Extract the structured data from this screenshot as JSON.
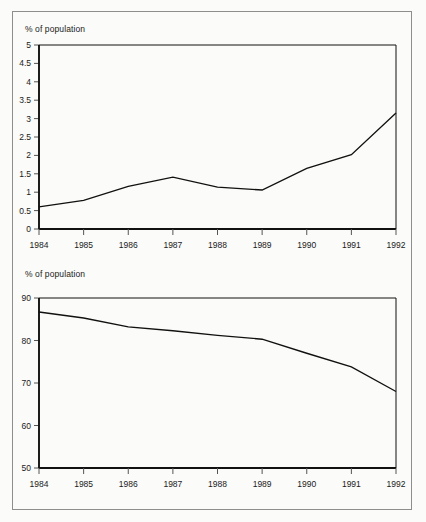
{
  "page": {
    "background_color": "#fbfbf9",
    "frame_color": "#8e8e8e",
    "ink_color": "#111111"
  },
  "charts": [
    {
      "id": "top-chart",
      "caption": "% of population",
      "y_ticks": [
        "5",
        "4.5",
        "4",
        "3.5",
        "3",
        "2.5",
        "2",
        "1.5",
        "1",
        "0.5",
        "0"
      ],
      "x_ticks": [
        "1984",
        "1985",
        "1986",
        "1987",
        "1988",
        "1989",
        "1990",
        "1991",
        "1992"
      ]
    },
    {
      "id": "bottom-chart",
      "caption": "% of population",
      "y_ticks": [
        "90",
        "80",
        "70",
        "60",
        "50"
      ],
      "x_ticks": [
        "1984",
        "1985",
        "1986",
        "1987",
        "1988",
        "1989",
        "1990",
        "1991",
        "1992"
      ]
    }
  ],
  "chart_data": [
    {
      "type": "line",
      "id": "top-chart",
      "title": "",
      "subtitle": "",
      "xlabel": "",
      "ylabel": "% of population",
      "categories": [
        "1984",
        "1985",
        "1986",
        "1987",
        "1988",
        "1989",
        "1990",
        "1991",
        "1992"
      ],
      "x": [
        1984,
        1985,
        1986,
        1987,
        1988,
        1989,
        1990,
        1991,
        1992
      ],
      "values": [
        0.6,
        0.78,
        1.16,
        1.41,
        1.14,
        1.06,
        1.65,
        2.02,
        3.15
      ],
      "ylim": [
        0,
        5
      ],
      "xlim": [
        1984,
        1992
      ],
      "y_tick_values": [
        0,
        0.5,
        1,
        1.5,
        2,
        2.5,
        3,
        3.5,
        4,
        4.5,
        5
      ],
      "grid": false,
      "legend": null,
      "legend_position": "none",
      "line_color": "#111111"
    },
    {
      "type": "line",
      "id": "bottom-chart",
      "title": "",
      "subtitle": "",
      "xlabel": "",
      "ylabel": "% of population",
      "categories": [
        "1984",
        "1985",
        "1986",
        "1987",
        "1988",
        "1989",
        "1990",
        "1991",
        "1992"
      ],
      "x": [
        1984,
        1985,
        1986,
        1987,
        1988,
        1989,
        1990,
        1991,
        1992
      ],
      "values": [
        86.7,
        85.3,
        83.2,
        82.3,
        81.2,
        80.3,
        77.0,
        73.8,
        68.0
      ],
      "ylim": [
        50,
        90
      ],
      "xlim": [
        1984,
        1992
      ],
      "y_tick_values": [
        50,
        60,
        70,
        80,
        90
      ],
      "grid": false,
      "legend": null,
      "legend_position": "none",
      "line_color": "#111111"
    }
  ]
}
